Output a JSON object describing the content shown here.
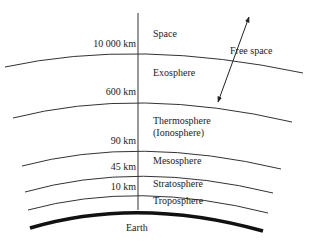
{
  "diagram": {
    "colors": {
      "line": "#333333",
      "earth": "#111111",
      "text": "#222222",
      "background": "#ffffff"
    },
    "altitudes": [
      {
        "label": "10 000 km"
      },
      {
        "label": "600 km"
      },
      {
        "label": "90 km"
      },
      {
        "label": "45 km"
      },
      {
        "label": "10 km"
      }
    ],
    "layers": [
      {
        "label": "Space"
      },
      {
        "label": "Exosphere"
      },
      {
        "label": "Thermosphere",
        "sublabel": "(Ionosphere)"
      },
      {
        "label": "Mesosphere"
      },
      {
        "label": "Stratosphere"
      },
      {
        "label": "Troposphere"
      }
    ],
    "free_space": {
      "label": "Free space",
      "icon": "double-arrow-icon"
    },
    "earth": {
      "label": "Earth"
    }
  }
}
